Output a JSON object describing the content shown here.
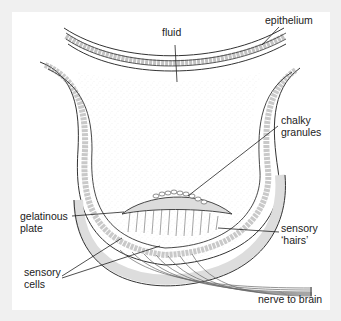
{
  "diagram": {
    "type": "labelled anatomical cross-section",
    "labels": {
      "fluid": "fluid",
      "epithelium": "epithelium",
      "chalky_granules": [
        "chalky",
        "granules"
      ],
      "gelatinous_plate": [
        "gelatinous",
        "plate"
      ],
      "sensory_hairs": [
        "sensory",
        "‘hairs’"
      ],
      "sensory_cells": [
        "sensory",
        "cells"
      ],
      "nerve": "nerve to brain"
    },
    "colors": {
      "outer_background": "#f0f0f0",
      "panel_background": "#ffffff",
      "line": "#333333",
      "wall_fill": "#e2e2e2",
      "cell_fill": "#f4f4f4"
    }
  }
}
